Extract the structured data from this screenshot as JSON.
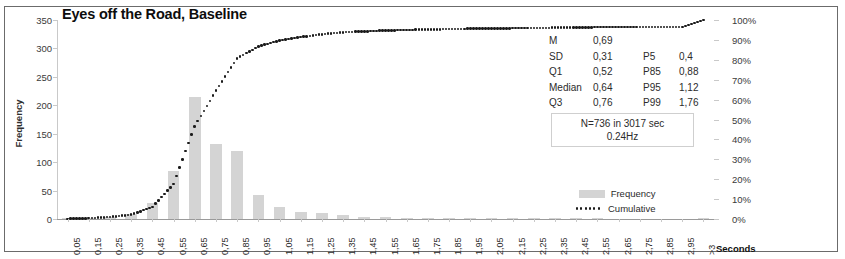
{
  "chart_data": {
    "type": "bar",
    "title": "Eyes off the Road, Baseline",
    "xlabel": "Seconds",
    "ylabel": "Frequency",
    "ylim": [
      0,
      350
    ],
    "y2lim": [
      0,
      100
    ],
    "grid": false,
    "legend_position": "inside-right",
    "categories": [
      "0,05",
      "0,15",
      "0,25",
      "0,35",
      "0,45",
      "0,55",
      "0,65",
      "0,75",
      "0,85",
      "0,95",
      "1,05",
      "1,15",
      "1,25",
      "1,35",
      "1,45",
      "1,55",
      "1,65",
      "1,75",
      "1,85",
      "1,95",
      "2,05",
      "2,15",
      "2,25",
      "2,35",
      "2,45",
      "2,55",
      "2,65",
      "2,75",
      "2,85",
      "2,95",
      ">3"
    ],
    "yticks": [
      0,
      50,
      100,
      150,
      200,
      250,
      300,
      350
    ],
    "y2ticks": [
      "0%",
      "10%",
      "20%",
      "30%",
      "40%",
      "50%",
      "60%",
      "70%",
      "80%",
      "90%",
      "100%"
    ],
    "series": [
      {
        "name": "Frequency",
        "type": "bar",
        "color": "#d4d4d4",
        "values": [
          1,
          2,
          4,
          9,
          29,
          84,
          214,
          132,
          120,
          43,
          22,
          13,
          10,
          7,
          4,
          3,
          2,
          2,
          2,
          1,
          1,
          1,
          1,
          1,
          1,
          1,
          0,
          0,
          0,
          0,
          1
        ]
      },
      {
        "name": "Cumulative",
        "type": "line",
        "color": "#1a1a1a",
        "values": [
          0.1,
          0.4,
          1.0,
          2.2,
          6.1,
          17.5,
          46.6,
          64.5,
          80.8,
          86.7,
          89.7,
          91.4,
          92.8,
          93.8,
          94.3,
          94.7,
          95.0,
          95.2,
          95.5,
          95.6,
          95.7,
          95.9,
          96.0,
          96.1,
          96.3,
          96.4,
          96.4,
          96.4,
          96.4,
          96.4,
          100.0
        ]
      }
    ]
  },
  "stats": {
    "rows": [
      {
        "label": "M",
        "value": "0,69",
        "label2": "",
        "value2": ""
      },
      {
        "label": "SD",
        "value": "0,31",
        "label2": "P5",
        "value2": "0,4"
      },
      {
        "label": "Q1",
        "value": "0,52",
        "label2": "P85",
        "value2": "0,88"
      },
      {
        "label": "Median",
        "value": "0,64",
        "label2": "P95",
        "value2": "1,12"
      },
      {
        "label": "Q3",
        "value": "0,76",
        "label2": "P99",
        "value2": "1,76"
      }
    ],
    "n_line": "N=736 in 3017 sec",
    "hz_line": "0.24Hz"
  }
}
